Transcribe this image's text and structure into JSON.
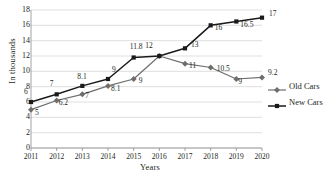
{
  "chart_data": {
    "type": "line",
    "title": "",
    "xlabel": "Years",
    "ylabel": "In thousands",
    "categories": [
      "2011",
      "2012",
      "2013",
      "2014",
      "2015",
      "2016",
      "2017",
      "2018",
      "2019",
      "2020"
    ],
    "ylim": [
      0,
      18
    ],
    "ytick_step": 2,
    "yticks": [
      "0",
      "2",
      "4",
      "6",
      "8",
      "10",
      "12",
      "14",
      "16",
      "18"
    ],
    "grid": true,
    "legend_position": "right",
    "series": [
      {
        "name": "Old Cars",
        "color": "#6e6e6e",
        "marker": "diamond",
        "values": [
          5,
          6.2,
          7,
          8.1,
          9,
          12,
          11,
          10.5,
          9,
          9.2
        ],
        "labels": [
          "5",
          "6.2",
          "7",
          "8.1",
          "9",
          "12",
          "11",
          "10.5",
          "9",
          "9.2"
        ]
      },
      {
        "name": "New Cars",
        "color": "#1a1a1a",
        "marker": "square",
        "values": [
          6,
          7,
          8.1,
          9,
          11.8,
          12,
          13,
          16,
          16.5,
          17
        ],
        "labels": [
          "6",
          "7",
          "8.1",
          "9",
          "11.8",
          "12",
          "13",
          "16",
          "16.5",
          "17"
        ]
      }
    ]
  },
  "legend": {
    "items": [
      {
        "label": "Old Cars"
      },
      {
        "label": "New Cars"
      }
    ]
  },
  "axes": {
    "y_title": "In thousands",
    "x_title": "Years"
  }
}
